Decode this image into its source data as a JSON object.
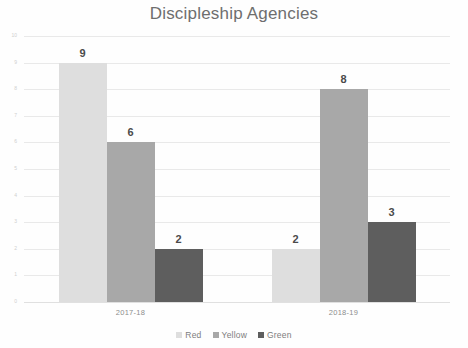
{
  "chart_data": {
    "type": "bar",
    "title": "Discipleship Agencies",
    "xlabel": "",
    "ylabel": "",
    "categories": [
      "2017-18",
      "2018-19"
    ],
    "series": [
      {
        "name": "Red",
        "values": [
          9,
          2
        ],
        "color": "#dedede"
      },
      {
        "name": "Yellow",
        "values": [
          6,
          8
        ],
        "color": "#a8a8a8"
      },
      {
        "name": "Green",
        "values": [
          2,
          3
        ],
        "color": "#5e5e5e"
      }
    ],
    "ylim": [
      0,
      10
    ],
    "ytick_labels": [
      "0",
      "1",
      "2",
      "3",
      "4",
      "5",
      "6",
      "7",
      "8",
      "9",
      "10"
    ],
    "ytick_values": [
      0,
      1,
      2,
      3,
      4,
      5,
      6,
      7,
      8,
      9,
      10
    ],
    "grid": true,
    "legend_position": "bottom",
    "data_labels": [
      {
        "category": "2017-18",
        "series": "Red",
        "value": "9"
      },
      {
        "category": "2017-18",
        "series": "Yellow",
        "value": "6"
      },
      {
        "category": "2017-18",
        "series": "Green",
        "value": "2"
      },
      {
        "category": "2018-19",
        "series": "Red",
        "value": "2"
      },
      {
        "category": "2018-19",
        "series": "Yellow",
        "value": "8"
      },
      {
        "category": "2018-19",
        "series": "Green",
        "value": "3"
      }
    ]
  },
  "legend": {
    "items": [
      {
        "label": "Red",
        "marker": "legend-swatch-red"
      },
      {
        "label": "Yellow",
        "marker": "legend-swatch-yellow"
      },
      {
        "label": "Green",
        "marker": "legend-swatch-green"
      }
    ]
  }
}
